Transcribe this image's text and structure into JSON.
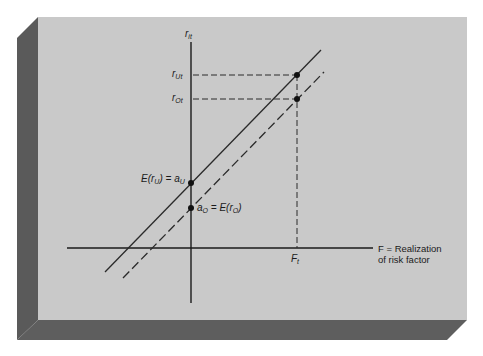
{
  "figure": {
    "colors": {
      "front_face": "#c9c9c9",
      "side_face": "#5a5a5a",
      "bottom_face": "#5e5e5e",
      "ink": "#1a1a1a",
      "background": "#ffffff"
    },
    "axes": {
      "y_label_main": "r",
      "y_label_sub": "it",
      "x_label_line1": "F = Realization",
      "x_label_line2": "of risk factor"
    },
    "ticks": {
      "rUt_main": "r",
      "rUt_sub": "Ut",
      "rOt_main": "r",
      "rOt_sub": "Ot",
      "Ft_main": "F",
      "Ft_sub": "t"
    },
    "annotations": {
      "upper_intercept": "E(r",
      "upper_intercept_sub": "U",
      "upper_intercept_rest": ") = a",
      "upper_intercept_sub2": "U",
      "lower_intercept_a": "a",
      "lower_intercept_sub": "O",
      "lower_intercept_rest": " = E(r",
      "lower_intercept_sub2": "O",
      "lower_intercept_close": ")"
    },
    "lines": [
      {
        "name": "unexpected-return-line",
        "style": "solid"
      },
      {
        "name": "expected-return-line",
        "style": "dashed"
      }
    ]
  }
}
